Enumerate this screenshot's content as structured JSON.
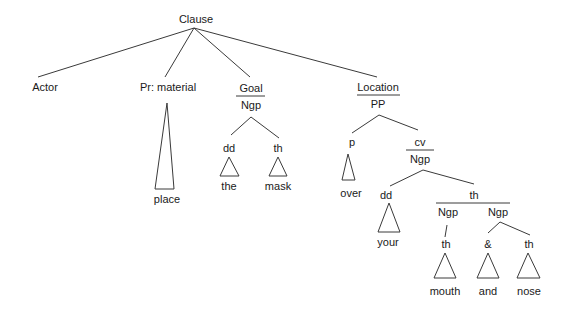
{
  "diagram": {
    "type": "syntax-tree",
    "root": {
      "label": "Clause",
      "children": [
        {
          "id": "actor",
          "label": "Actor"
        },
        {
          "id": "process",
          "label": "Pr: material",
          "realization": "place"
        },
        {
          "id": "goal",
          "function": "Goal",
          "class": "Ngp",
          "children": [
            {
              "function": "dd",
              "realization": "the"
            },
            {
              "function": "th",
              "realization": "mask"
            }
          ]
        },
        {
          "id": "location",
          "function": "Location",
          "class": "PP",
          "children": [
            {
              "function": "p",
              "realization": "over"
            },
            {
              "function": "cv",
              "class": "Ngp",
              "children": [
                {
                  "function": "dd",
                  "realization": "your"
                },
                {
                  "function": "th",
                  "children": [
                    {
                      "class": "Ngp",
                      "children": [
                        {
                          "function": "th",
                          "realization": "mouth"
                        }
                      ]
                    },
                    {
                      "class": "Ngp",
                      "children": [
                        {
                          "function": "&",
                          "realization": "and"
                        },
                        {
                          "function": "th",
                          "realization": "nose"
                        }
                      ]
                    }
                  ]
                }
              ]
            }
          ]
        }
      ]
    }
  },
  "labels": {
    "clause": "Clause",
    "actor": "Actor",
    "pr_material": "Pr: material",
    "place": "place",
    "goal": "Goal",
    "goal_ngp": "Ngp",
    "goal_dd": "dd",
    "goal_th": "th",
    "the": "the",
    "mask": "mask",
    "location": "Location",
    "pp": "PP",
    "p": "p",
    "over": "over",
    "cv": "cv",
    "cv_ngp": "Ngp",
    "cv_dd": "dd",
    "your": "your",
    "cv_th": "th",
    "ngp_left": "Ngp",
    "ngp_right": "Ngp",
    "th_mouth": "th",
    "amp": "&",
    "th_nose": "th",
    "mouth": "mouth",
    "and": "and",
    "nose": "nose"
  }
}
